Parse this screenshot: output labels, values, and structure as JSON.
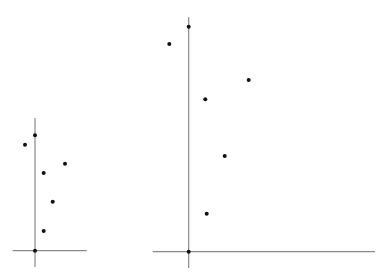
{
  "colors": {
    "background": "#ffffff",
    "axis": "#8a8a8a",
    "point": "#111111"
  },
  "chart_data": [
    {
      "type": "scatter",
      "title": "",
      "xlabel": "",
      "ylabel": "",
      "grid": false,
      "legend": null,
      "axes_px": {
        "origin": [
          35,
          250.7
        ],
        "x_span": [
          12.7,
          86.7
        ],
        "y_span": [
          118,
          267
        ]
      },
      "points_px": [
        [
          35,
          135.3
        ],
        [
          25,
          144.7
        ],
        [
          65,
          163.7
        ],
        [
          43.7,
          173
        ],
        [
          52.7,
          201.7
        ],
        [
          43.7,
          231
        ],
        [
          35,
          250.7
        ]
      ],
      "points_relative_to_origin": [
        [
          0,
          115.4
        ],
        [
          -10,
          106
        ],
        [
          30,
          87
        ],
        [
          8.7,
          77.7
        ],
        [
          17.7,
          49
        ],
        [
          8.7,
          19.7
        ],
        [
          0,
          0
        ]
      ]
    },
    {
      "type": "scatter",
      "title": "",
      "xlabel": "",
      "ylabel": "",
      "grid": false,
      "legend": null,
      "axes_px": {
        "origin": [
          188.7,
          251.7
        ],
        "x_span": [
          152.7,
          375
        ],
        "y_span": [
          17,
          268
        ]
      },
      "points_px": [
        [
          188.7,
          26.7
        ],
        [
          169.3,
          44
        ],
        [
          248.7,
          80
        ],
        [
          205.3,
          99.3
        ],
        [
          224.7,
          156
        ],
        [
          206.7,
          213.7
        ],
        [
          188.7,
          251.7
        ]
      ],
      "points_relative_to_origin": [
        [
          0,
          225
        ],
        [
          -19.4,
          207.7
        ],
        [
          60,
          171.7
        ],
        [
          16.6,
          152.4
        ],
        [
          36,
          95.7
        ],
        [
          18,
          38
        ],
        [
          0,
          0
        ]
      ]
    }
  ]
}
